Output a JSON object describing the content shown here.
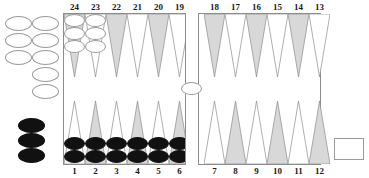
{
  "board": {
    "title": "Backgammon Board",
    "board_color": "#ffffff",
    "line_color": "#8d8d8d",
    "point_shaded_color": "#d8d8d8",
    "point_light_color": "#ffffff",
    "checker_white_color": "#ffffff",
    "checker_black_color": "#111111",
    "top_labels": [
      "24",
      "23",
      "22",
      "21",
      "20",
      "19",
      "18",
      "17",
      "16",
      "15",
      "14",
      "13"
    ],
    "bottom_labels": [
      "1",
      "2",
      "3",
      "4",
      "5",
      "6",
      "7",
      "8",
      "9",
      "10",
      "11",
      "12"
    ],
    "top_points": [
      {
        "label": "24",
        "shaded": true,
        "checkers": 3,
        "color": "white"
      },
      {
        "label": "23",
        "shaded": false,
        "checkers": 3,
        "color": "white"
      },
      {
        "label": "22",
        "shaded": true,
        "checkers": 0,
        "color": ""
      },
      {
        "label": "21",
        "shaded": false,
        "checkers": 0,
        "color": ""
      },
      {
        "label": "20",
        "shaded": true,
        "checkers": 0,
        "color": ""
      },
      {
        "label": "19",
        "shaded": false,
        "checkers": 0,
        "color": ""
      },
      {
        "label": "18",
        "shaded": true,
        "checkers": 0,
        "color": ""
      },
      {
        "label": "17",
        "shaded": false,
        "checkers": 0,
        "color": ""
      },
      {
        "label": "16",
        "shaded": true,
        "checkers": 0,
        "color": ""
      },
      {
        "label": "15",
        "shaded": false,
        "checkers": 0,
        "color": ""
      },
      {
        "label": "14",
        "shaded": true,
        "checkers": 0,
        "color": ""
      },
      {
        "label": "13",
        "shaded": false,
        "checkers": 0,
        "color": ""
      }
    ],
    "bottom_points": [
      {
        "label": "1",
        "shaded": false,
        "checkers": 2,
        "color": "black"
      },
      {
        "label": "2",
        "shaded": true,
        "checkers": 2,
        "color": "black"
      },
      {
        "label": "3",
        "shaded": false,
        "checkers": 2,
        "color": "black"
      },
      {
        "label": "4",
        "shaded": true,
        "checkers": 2,
        "color": "black"
      },
      {
        "label": "5",
        "shaded": false,
        "checkers": 2,
        "color": "black"
      },
      {
        "label": "6",
        "shaded": true,
        "checkers": 2,
        "color": "black"
      },
      {
        "label": "7",
        "shaded": false,
        "checkers": 0,
        "color": ""
      },
      {
        "label": "8",
        "shaded": true,
        "checkers": 0,
        "color": ""
      },
      {
        "label": "9",
        "shaded": false,
        "checkers": 0,
        "color": ""
      },
      {
        "label": "10",
        "shaded": true,
        "checkers": 0,
        "color": ""
      },
      {
        "label": "11",
        "shaded": false,
        "checkers": 0,
        "color": ""
      },
      {
        "label": "12",
        "shaded": true,
        "checkers": 0,
        "color": ""
      }
    ],
    "bar": {
      "white_checkers": 1,
      "black_checkers": 0
    },
    "off_board_white": {
      "count": 8,
      "left_column": 3,
      "right_column": 5
    },
    "off_board_black": {
      "count": 3
    },
    "bearoff_tray": {
      "label": "",
      "count": 0
    }
  }
}
